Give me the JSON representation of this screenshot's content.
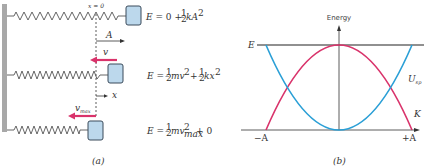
{
  "panel_a": {
    "caption": "(a)",
    "origin_label": "x = 0",
    "amplitude_label": "A",
    "velocity_label": "v",
    "vmax_label": "v",
    "vmax_sub": "max",
    "x_label": "x",
    "equations": [
      {
        "lhs": "E",
        "rhs": "= 0 + ½kA²"
      },
      {
        "lhs": "E",
        "rhs": "= ½mv² + ½kx²"
      },
      {
        "lhs": "E",
        "rhs": "= ½mv²max + 0"
      }
    ],
    "colors": {
      "spring": "#555555",
      "block": "#bcd8ec",
      "block_border": "#3a4a5a",
      "arrow": "#d9336b",
      "wall": "#999999"
    }
  },
  "panel_b": {
    "caption": "(b)",
    "y_axis_label": "Energy",
    "total_energy_label": "E",
    "potential_label": "U",
    "potential_sub": "sp",
    "kinetic_label": "K",
    "x_left_label": "−A",
    "x_right_label": "+A",
    "colors": {
      "kinetic": "#d9336b",
      "potential": "#2a9fd6",
      "total": "#222222",
      "axis": "#333333"
    }
  }
}
